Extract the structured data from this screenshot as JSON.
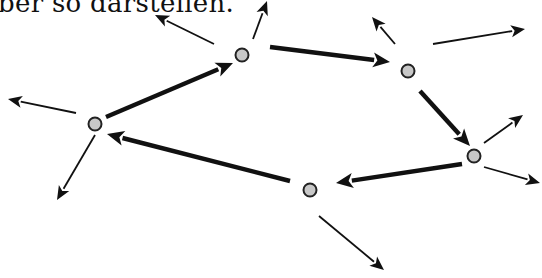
{
  "caption": "ber so darstellen.",
  "colors": {
    "node_fill": "#c8c8c8",
    "node_stroke": "#222222",
    "arrow": "#111111"
  },
  "nodes": [
    {
      "id": "n1"
    },
    {
      "id": "n2"
    },
    {
      "id": "n3"
    },
    {
      "id": "n4"
    },
    {
      "id": "n5"
    }
  ],
  "cycle_edges": [
    {
      "from": "n1",
      "to": "n2"
    },
    {
      "from": "n2",
      "to": "n3"
    },
    {
      "from": "n3",
      "to": "n4"
    },
    {
      "from": "n4",
      "to": "n5"
    },
    {
      "from": "n5",
      "to": "n1"
    }
  ],
  "outgoing_edges": [
    {
      "from": "n1",
      "direction": "up-left"
    },
    {
      "from": "n1",
      "direction": "up"
    },
    {
      "from": "n2",
      "direction": "up-left"
    },
    {
      "from": "n2",
      "direction": "right"
    },
    {
      "from": "n3",
      "direction": "up-right"
    },
    {
      "from": "n3",
      "direction": "down-right"
    },
    {
      "from": "n4",
      "direction": "down-right"
    },
    {
      "from": "n5",
      "direction": "left"
    },
    {
      "from": "n5",
      "direction": "down-left"
    }
  ]
}
